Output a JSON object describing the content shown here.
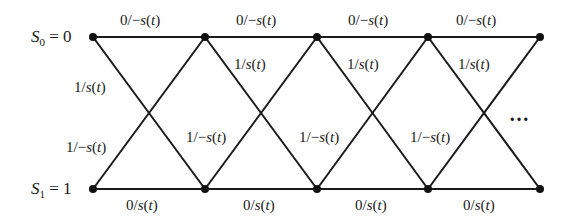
{
  "diagram": {
    "type": "trellis",
    "line_color": "#1a1a1a",
    "states": [
      {
        "id": "S0",
        "symbol": "S",
        "subscript": "0",
        "equals": "= 0",
        "row_y": 37
      },
      {
        "id": "S1",
        "symbol": "S",
        "subscript": "1",
        "equals": "= 1",
        "row_y": 189
      }
    ],
    "node_x": [
      93,
      205,
      317,
      428,
      540
    ],
    "continuation": "…",
    "labels": {
      "top_branch": "0/−s(t)",
      "top_to_bottom": "1/s(t)",
      "bottom_to_top": "1/−s(t)",
      "bottom_branch": "0/s(t)"
    },
    "top_labels": [
      "0/−s(t)",
      "0/−s(t)",
      "0/−s(t)",
      "0/−s(t)"
    ],
    "bottom_labels": [
      "0/s(t)",
      "0/s(t)",
      "0/s(t)",
      "0/s(t)"
    ],
    "down_labels": [
      "1/s(t)",
      "1/s(t)",
      "1/s(t)",
      "1/s(t)"
    ],
    "up_labels": [
      "1/−s(t)",
      "1/−s(t)",
      "1/−s(t)",
      "1/−s(t)"
    ]
  }
}
